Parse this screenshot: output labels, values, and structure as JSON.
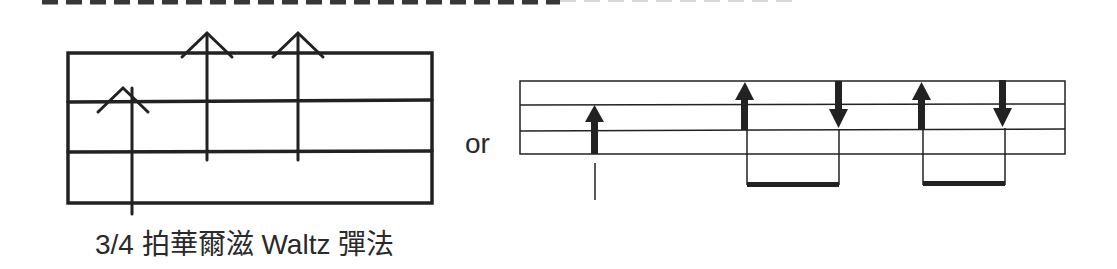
{
  "diagram": {
    "caption": "3/4 拍華爾滋 Waltz 彈法",
    "connector_label": "or",
    "colors": {
      "ink": "#222222",
      "background": "#ffffff"
    },
    "left_figure": {
      "type": "strum-pattern-grid",
      "lines": 4,
      "arrows": [
        {
          "direction": "up",
          "style": "open-chevron",
          "beat": 1
        },
        {
          "direction": "up",
          "style": "open-chevron",
          "beat": 2
        },
        {
          "direction": "up",
          "style": "open-chevron",
          "beat": 3
        }
      ]
    },
    "right_figure": {
      "type": "strum-pattern-staff",
      "lines": 4,
      "arrows": [
        {
          "direction": "up",
          "style": "solid",
          "beat": 1,
          "note": "quarter"
        },
        {
          "direction": "up",
          "style": "solid",
          "beat": 2,
          "note": "eighth-beamed"
        },
        {
          "direction": "down",
          "style": "solid",
          "beat": 2.5,
          "note": "eighth-beamed"
        },
        {
          "direction": "up",
          "style": "solid",
          "beat": 3,
          "note": "eighth-beamed"
        },
        {
          "direction": "down",
          "style": "solid",
          "beat": 3.5,
          "note": "eighth-beamed"
        }
      ]
    }
  }
}
